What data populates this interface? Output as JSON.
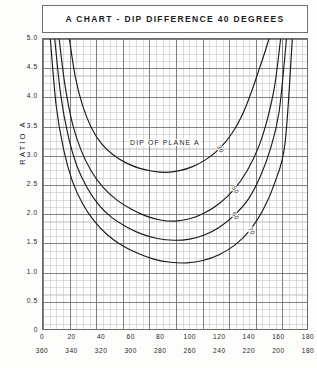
{
  "title": {
    "text": "A CHART - DIP DIFFERENCE 40 DEGREES"
  },
  "axes": {
    "y_title": "RATIO A",
    "y_ticks": [
      "5.0",
      "4.5",
      "4.0",
      "3.5",
      "3.0",
      "2.5",
      "2.0",
      "1.5",
      "1.0",
      "0.5",
      "0"
    ],
    "x_ticks_top": [
      "0",
      "20",
      "40",
      "60",
      "80",
      "100",
      "120",
      "140",
      "160",
      "180"
    ],
    "x_ticks_bottom": [
      "360",
      "340",
      "320",
      "300",
      "280",
      "260",
      "240",
      "220",
      "200",
      "180"
    ]
  },
  "annotations": {
    "dip_of_plane": "DIP OF PLANE A"
  },
  "curve_labels": [
    "30",
    "50",
    "60",
    "70"
  ],
  "colors": {
    "ink": "#1d1d1d",
    "curve": "#1a1a1a",
    "grid_major": "#4b4b4b",
    "grid_minor": "#6e6e6e",
    "frame": "#6b6b6b",
    "background": "#fdfdfc"
  },
  "chart_data": {
    "type": "line",
    "title": "A CHART - DIP DIFFERENCE 40 DEGREES",
    "xlabel": "",
    "ylabel": "RATIO A",
    "xlim": [
      0,
      180
    ],
    "xlim_secondary": [
      360,
      180
    ],
    "ylim": [
      0,
      5.0
    ],
    "grid": true,
    "legend": "inline-curve-labels",
    "annotation": "DIP OF PLANE A",
    "x_axis_top_ticks": [
      0,
      20,
      40,
      60,
      80,
      100,
      120,
      140,
      160,
      180
    ],
    "x_axis_bottom_ticks": [
      360,
      340,
      320,
      300,
      280,
      260,
      240,
      220,
      200,
      180
    ],
    "y_axis_ticks": [
      0,
      0.5,
      1.0,
      1.5,
      2.0,
      2.5,
      3.0,
      3.5,
      4.0,
      4.5,
      5.0
    ],
    "series": [
      {
        "name": "30",
        "label": "30",
        "x": [
          18,
          22,
          27,
          33,
          40,
          48,
          57,
          66,
          75,
          84,
          93,
          102,
          111,
          120,
          129,
          136,
          142,
          147,
          151,
          154
        ],
        "values": [
          5.0,
          4.35,
          3.85,
          3.47,
          3.19,
          3.0,
          2.86,
          2.77,
          2.72,
          2.7,
          2.73,
          2.8,
          2.92,
          3.1,
          3.38,
          3.7,
          4.08,
          4.45,
          4.75,
          5.0
        ]
      },
      {
        "name": "50",
        "label": "50",
        "x": [
          11,
          15,
          20,
          26,
          33,
          41,
          50,
          60,
          70,
          80,
          90,
          100,
          110,
          120,
          130,
          139,
          147,
          153,
          158,
          162
        ],
        "values": [
          5.0,
          4.2,
          3.55,
          3.08,
          2.72,
          2.44,
          2.23,
          2.07,
          1.95,
          1.88,
          1.86,
          1.9,
          2.0,
          2.16,
          2.4,
          2.72,
          3.14,
          3.62,
          4.2,
          5.0
        ]
      },
      {
        "name": "60",
        "label": "60",
        "x": [
          8,
          12,
          17,
          23,
          30,
          38,
          47,
          57,
          67,
          78,
          89,
          100,
          110,
          120,
          130,
          140,
          148,
          155,
          161,
          166
        ],
        "values": [
          5.0,
          4.05,
          3.35,
          2.82,
          2.44,
          2.14,
          1.92,
          1.76,
          1.64,
          1.56,
          1.53,
          1.55,
          1.62,
          1.75,
          1.95,
          2.24,
          2.62,
          3.1,
          3.75,
          5.0
        ]
      },
      {
        "name": "70",
        "label": "70",
        "x": [
          5,
          9,
          14,
          20,
          27,
          35,
          44,
          54,
          65,
          76,
          87,
          98,
          109,
          120,
          131,
          141,
          150,
          158,
          165,
          170
        ],
        "values": [
          5.0,
          3.85,
          3.1,
          2.55,
          2.16,
          1.86,
          1.62,
          1.44,
          1.3,
          1.2,
          1.15,
          1.14,
          1.18,
          1.28,
          1.45,
          1.7,
          2.05,
          2.52,
          3.2,
          5.0
        ]
      }
    ]
  }
}
